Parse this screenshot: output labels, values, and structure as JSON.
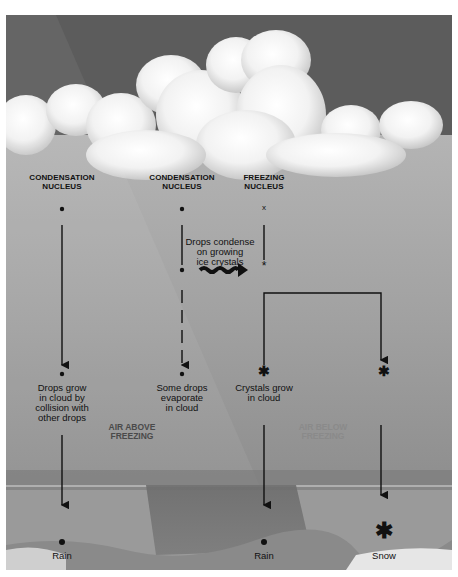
{
  "diagram": {
    "columns": [
      {
        "id": "col1",
        "header": [
          "CONDENSATION",
          "NUCLEUS"
        ],
        "start_symbol": "dot",
        "mid_label": [
          "Drops grow",
          "in cloud by",
          "collision with",
          "other drops"
        ],
        "end_label": "Rain"
      },
      {
        "id": "col2",
        "header": [
          "CONDENSATION",
          "NUCLEUS"
        ],
        "start_symbol": "dot",
        "mid_label": [
          "Some drops",
          "evaporate",
          "in cloud"
        ],
        "line_style": "dashed"
      },
      {
        "id": "col3",
        "header": [
          "FREEZING",
          "NUCLEUS"
        ],
        "start_symbol": "x",
        "mid_label": [
          "Crystals grow",
          "in cloud"
        ],
        "end_label": "Rain"
      },
      {
        "id": "col4",
        "start_symbol": "asterisk",
        "end_label": "Snow"
      }
    ],
    "transfer_label": [
      "Drops condense",
      "on growing",
      "ice crystals"
    ],
    "zones": {
      "above": [
        "AIR ABOVE",
        "FREEZING"
      ],
      "below": [
        "AIR BELOW",
        "FREEZING"
      ]
    },
    "colors": {
      "sky_top": "#5c5c5c",
      "cloud_body": "#a8a8a8",
      "ink": "#111111",
      "zone_above_text": "#4a4a4a",
      "zone_below_text": "#8a8a8a"
    }
  }
}
